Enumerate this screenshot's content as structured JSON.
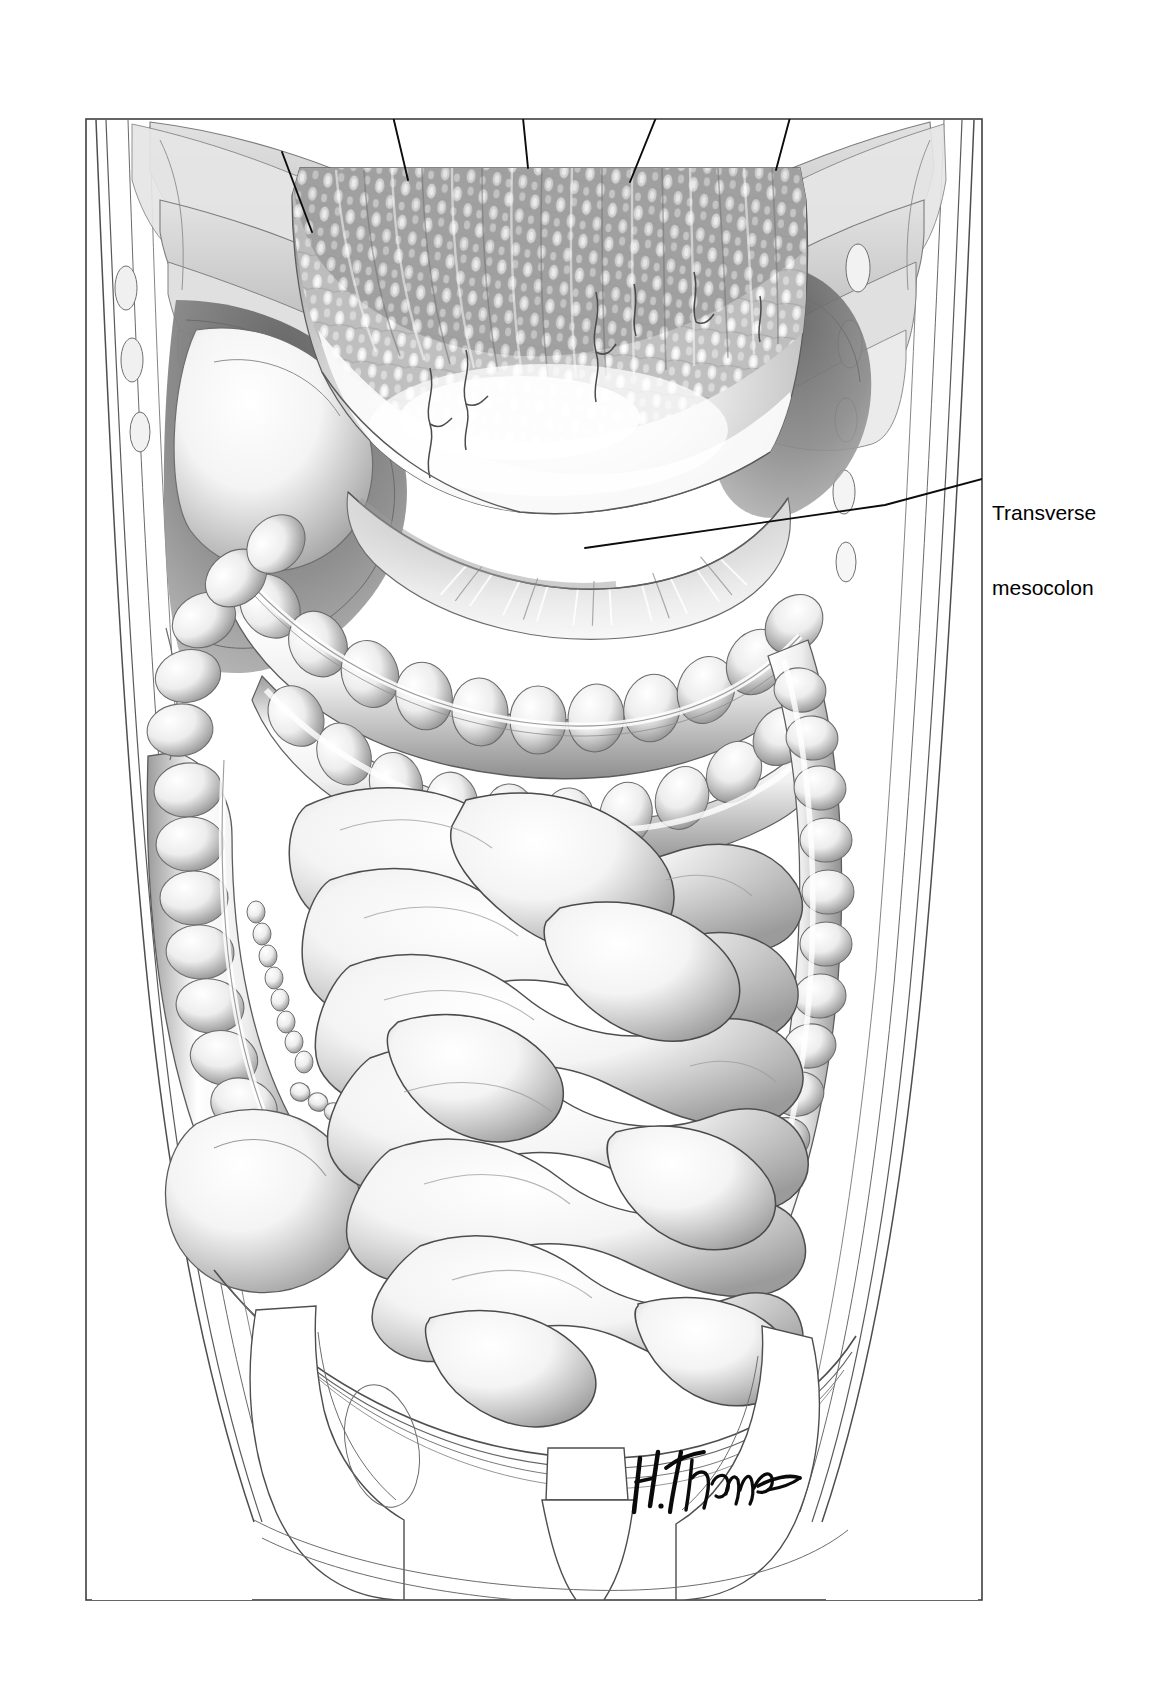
{
  "figure": {
    "domain": "anatomical-illustration",
    "medium": "pen-and-ink / airbrush grayscale medical illustration",
    "frame": {
      "x": 85,
      "y": 118,
      "width": 898,
      "height": 1483,
      "stroke": "#3a3a3a",
      "fill": "#ffffff"
    },
    "background": "#ffffff",
    "signature": {
      "text": "H. Thomas",
      "x": 640,
      "y": 1488
    }
  },
  "labels": [
    {
      "id": "transverse-mesocolon",
      "line1": "Transverse",
      "line2": "mesocolon",
      "text_x": 992,
      "text_y": 450,
      "leader": {
        "x1": 986,
        "y1": 478,
        "x2": 885,
        "y2": 505,
        "x3": 585,
        "y3": 548
      }
    }
  ],
  "leader_lines_unlabeled": [
    {
      "id": "omentum-pointer-1",
      "x1": 282,
      "y1": 152,
      "x2": 312,
      "y2": 232
    },
    {
      "id": "omentum-pointer-2",
      "x1": 392,
      "y1": 112,
      "x2": 408,
      "y2": 180
    },
    {
      "id": "omentum-pointer-3",
      "x1": 520,
      "y1": 88,
      "x2": 528,
      "y2": 168
    },
    {
      "id": "omentum-pointer-4",
      "x1": 672,
      "y1": 78,
      "x2": 630,
      "y2": 182
    },
    {
      "id": "omentum-pointer-5",
      "x1": 800,
      "y1": 80,
      "x2": 776,
      "y2": 170
    }
  ],
  "structures": [
    {
      "id": "rib-cage-left",
      "name": "Rib cage (left costal margin)",
      "tone": "#d9d9d9"
    },
    {
      "id": "rib-cage-right",
      "name": "Rib cage (right costal margin)",
      "tone": "#d9d9d9"
    },
    {
      "id": "abdominal-wall",
      "name": "Abdominal wall layers",
      "tone": "#ffffff"
    },
    {
      "id": "greater-omentum",
      "name": "Greater omentum (reflected upward)",
      "tone": "#b9b9b9"
    },
    {
      "id": "omental-vessels",
      "name": "Omental blood vessels",
      "tone": "#555555"
    },
    {
      "id": "transverse-colon",
      "name": "Transverse colon",
      "tone": "#e8e8e8"
    },
    {
      "id": "transverse-mesocolon",
      "name": "Transverse mesocolon",
      "tone": "#dcdcdc"
    },
    {
      "id": "ascending-colon",
      "name": "Ascending colon",
      "tone": "#eaeaea"
    },
    {
      "id": "descending-colon",
      "name": "Descending colon",
      "tone": "#eaeaea"
    },
    {
      "id": "cecum",
      "name": "Cecum",
      "tone": "#ededed"
    },
    {
      "id": "epiploic-appendices",
      "name": "Epiploic appendices",
      "tone": "#e0e0e0"
    },
    {
      "id": "small-intestine",
      "name": "Small intestine (jejunum and ileum)",
      "tone": "#f2f2f2"
    },
    {
      "id": "peritoneal-recess",
      "name": "Peritoneal recess (shadowed)",
      "tone": "#8e8e8e"
    },
    {
      "id": "pelvic-bones",
      "name": "Pelvic bones (iliac crests, sacrum)",
      "tone": "#ffffff"
    }
  ],
  "palette": {
    "ink": "#1a1a1a",
    "outline": "#4a4a4a",
    "hairline": "#6e6e6e",
    "fat_mid": "#9a9a9a",
    "fat_dark": "#6a6a6a",
    "shadow_deep": "#7c7c7c",
    "bowel_light": "#fbfbfb",
    "bowel_shade": "#a8a8a8",
    "paper": "#ffffff"
  }
}
